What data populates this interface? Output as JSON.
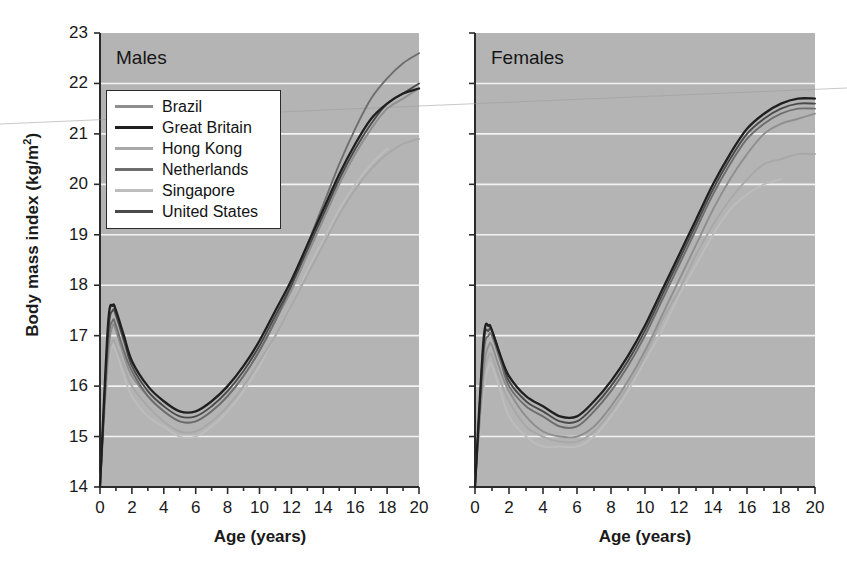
{
  "figure": {
    "xlabel": "Age (years)",
    "ylabel_main": "Body mass index (kg/m",
    "ylabel_sup": "2",
    "ylabel_close": ")",
    "background_color": "#b4b4b4",
    "gridline_color": "#f2f2f2"
  },
  "panels": [
    {
      "title": "Males"
    },
    {
      "title": "Females"
    }
  ],
  "legend": {
    "entries": [
      {
        "label": "Brazil",
        "color": "#8f8f8f"
      },
      {
        "label": "Great Britain",
        "color": "#1f1f1f"
      },
      {
        "label": "Hong Kong",
        "color": "#a8a8a8"
      },
      {
        "label": "Netherlands",
        "color": "#6e6e6e"
      },
      {
        "label": "Singapore",
        "color": "#bdbdbd"
      },
      {
        "label": "United States",
        "color": "#4a4a4a"
      }
    ]
  },
  "axes": {
    "y_ticks": [
      "23",
      "22",
      "21",
      "20",
      "19",
      "18",
      "17",
      "16",
      "15",
      "14"
    ],
    "x_ticks": [
      "0",
      "2",
      "4",
      "6",
      "8",
      "10",
      "12",
      "14",
      "16",
      "18",
      "20"
    ]
  },
  "chart_data": {
    "type": "line",
    "xlabel": "Age (years)",
    "ylabel": "Body mass index (kg/m2)",
    "xlim": [
      0,
      20
    ],
    "ylim": [
      14,
      23
    ],
    "grid": true,
    "legend_position": "upper-left-of-first-panel",
    "x": [
      0,
      0.5,
      0.8,
      1,
      1.5,
      2,
      3,
      4,
      5,
      6,
      7,
      8,
      9,
      10,
      11,
      12,
      13,
      14,
      15,
      16,
      17,
      18,
      19,
      20
    ],
    "panels": [
      {
        "name": "Males",
        "series": [
          {
            "name": "Brazil",
            "color": "#8f8f8f",
            "values": [
              14.0,
              16.6,
              17.2,
              17.1,
              16.6,
              16.2,
              15.8,
              15.5,
              15.3,
              15.3,
              15.5,
              15.8,
              16.2,
              16.7,
              17.3,
              17.9,
              18.6,
              19.3,
              20.0,
              20.6,
              21.1,
              21.5,
              21.7,
              21.9
            ]
          },
          {
            "name": "Great Britain",
            "color": "#1f1f1f",
            "values": [
              14.0,
              17.2,
              17.6,
              17.5,
              17.0,
              16.5,
              16.0,
              15.7,
              15.5,
              15.5,
              15.7,
              16.0,
              16.4,
              16.9,
              17.5,
              18.1,
              18.8,
              19.5,
              20.2,
              20.8,
              21.3,
              21.6,
              21.8,
              21.9
            ]
          },
          {
            "name": "Hong Kong",
            "color": "#a8a8a8",
            "values": [
              14.0,
              16.4,
              16.9,
              16.8,
              16.4,
              16.0,
              15.6,
              15.3,
              15.1,
              15.1,
              15.3,
              15.6,
              16.0,
              16.5,
              17.0,
              17.6,
              18.2,
              18.8,
              19.4,
              19.9,
              20.3,
              20.6,
              20.8,
              20.9
            ]
          },
          {
            "name": "Netherlands",
            "color": "#6e6e6e",
            "values": [
              14.0,
              16.8,
              17.3,
              17.2,
              16.7,
              16.3,
              15.8,
              15.5,
              15.3,
              15.3,
              15.5,
              15.8,
              16.2,
              16.7,
              17.3,
              18.0,
              18.8,
              19.6,
              20.4,
              21.1,
              21.7,
              22.1,
              22.4,
              22.6
            ]
          },
          {
            "name": "Singapore",
            "color": "#bdbdbd",
            "values": [
              14.0,
              16.3,
              16.8,
              16.7,
              16.2,
              15.8,
              15.4,
              15.2,
              15.0,
              15.0,
              15.2,
              15.5,
              15.9,
              16.4,
              17.0,
              17.6,
              18.3,
              18.9,
              19.5,
              20.0,
              20.4,
              20.7,
              null,
              null
            ]
          },
          {
            "name": "United States",
            "color": "#4a4a4a",
            "values": [
              14.0,
              17.0,
              17.5,
              17.4,
              16.9,
              16.4,
              15.9,
              15.6,
              15.4,
              15.4,
              15.6,
              15.9,
              16.3,
              16.8,
              17.4,
              18.0,
              18.7,
              19.4,
              20.1,
              20.7,
              21.2,
              21.6,
              21.8,
              22.0
            ]
          }
        ]
      },
      {
        "name": "Females",
        "series": [
          {
            "name": "Brazil",
            "color": "#8f8f8f",
            "values": [
              14.0,
              16.3,
              16.8,
              16.8,
              16.3,
              15.9,
              15.4,
              15.1,
              15.0,
              15.0,
              15.2,
              15.6,
              16.1,
              16.7,
              17.4,
              18.1,
              18.8,
              19.5,
              20.1,
              20.6,
              21.0,
              21.2,
              21.3,
              21.4
            ]
          },
          {
            "name": "Great Britain",
            "color": "#1f1f1f",
            "values": [
              14.0,
              16.9,
              17.2,
              17.1,
              16.6,
              16.2,
              15.8,
              15.6,
              15.4,
              15.4,
              15.7,
              16.1,
              16.6,
              17.2,
              17.9,
              18.6,
              19.3,
              20.0,
              20.6,
              21.1,
              21.4,
              21.6,
              21.7,
              21.7
            ]
          },
          {
            "name": "Hong Kong",
            "color": "#a8a8a8",
            "values": [
              14.0,
              16.1,
              16.6,
              16.6,
              16.1,
              15.7,
              15.2,
              15.0,
              14.9,
              14.9,
              15.1,
              15.5,
              16.0,
              16.6,
              17.3,
              17.9,
              18.6,
              19.2,
              19.7,
              20.1,
              20.4,
              20.5,
              20.6,
              20.6
            ]
          },
          {
            "name": "Netherlands",
            "color": "#6e6e6e",
            "values": [
              14.0,
              16.6,
              17.0,
              17.0,
              16.5,
              16.0,
              15.6,
              15.4,
              15.2,
              15.2,
              15.5,
              15.9,
              16.4,
              17.0,
              17.7,
              18.4,
              19.1,
              19.8,
              20.4,
              20.9,
              21.2,
              21.4,
              21.5,
              21.5
            ]
          },
          {
            "name": "Singapore",
            "color": "#bdbdbd",
            "values": [
              14.0,
              15.9,
              16.4,
              16.4,
              15.9,
              15.4,
              15.0,
              14.8,
              14.8,
              14.8,
              15.0,
              15.4,
              15.9,
              16.5,
              17.1,
              17.8,
              18.4,
              19.0,
              19.5,
              19.8,
              20.0,
              20.1,
              null,
              null
            ]
          },
          {
            "name": "United States",
            "color": "#4a4a4a",
            "values": [
              14.0,
              16.8,
              17.1,
              17.1,
              16.6,
              16.1,
              15.7,
              15.5,
              15.3,
              15.3,
              15.6,
              16.0,
              16.5,
              17.1,
              17.8,
              18.5,
              19.2,
              19.9,
              20.5,
              21.0,
              21.3,
              21.5,
              21.6,
              21.6
            ]
          }
        ]
      }
    ]
  }
}
